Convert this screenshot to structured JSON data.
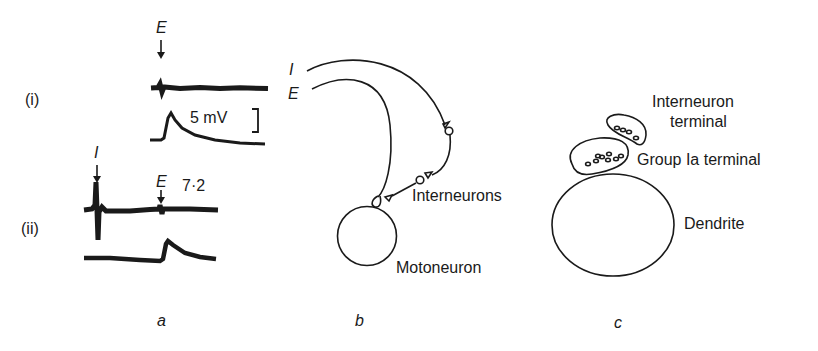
{
  "figure": {
    "panel_a": {
      "label": "a",
      "row_i": {
        "label": "(i)",
        "stimulus_label": "E",
        "scale_label": "5 mV"
      },
      "row_ii": {
        "label": "(ii)",
        "stimulus_1_label": "I",
        "stimulus_2_label": "E",
        "interval_label": "7·2"
      }
    },
    "panel_b": {
      "label": "b",
      "input_1_label": "I",
      "input_2_label": "E",
      "interneurons_label": "Interneurons",
      "motoneuron_label": "Motoneuron"
    },
    "panel_c": {
      "label": "c",
      "interneuron_terminal_line1": "Interneuron",
      "interneuron_terminal_line2": "terminal",
      "group_ia_terminal_label": "Group Ia terminal",
      "dendrite_label": "Dendrite"
    }
  },
  "colors": {
    "ink": "#1a1a1a",
    "background": "#ffffff"
  }
}
